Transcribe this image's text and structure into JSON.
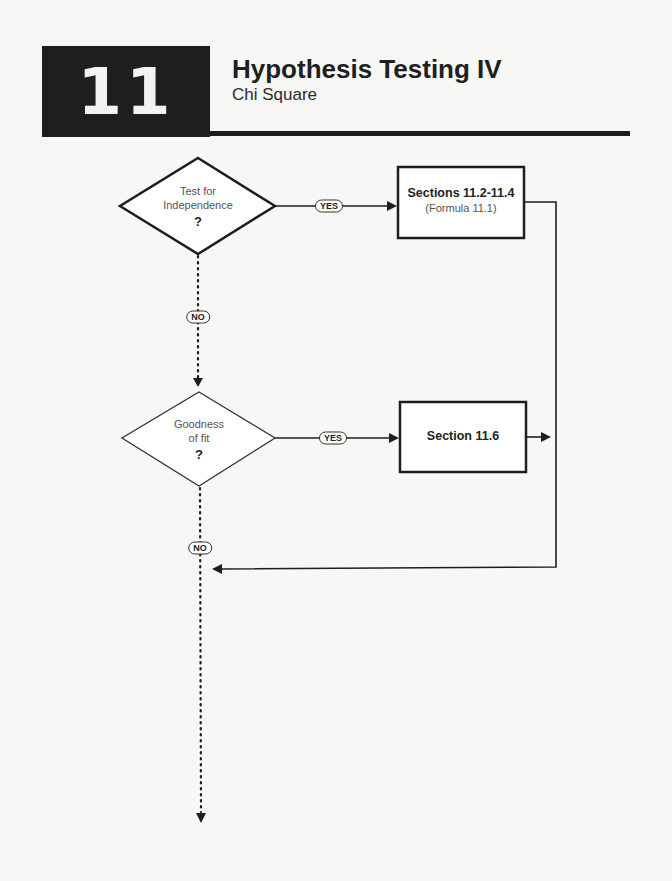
{
  "header": {
    "chapter_number": "11",
    "title": "Hypothesis Testing IV",
    "subtitle": "Chi Square"
  },
  "flowchart": {
    "decisions": [
      {
        "label_line1": "Test for",
        "label_line2": "Independence",
        "mark": "?"
      },
      {
        "label_line1": "Goodness",
        "label_line2": "of fit",
        "mark": "?"
      }
    ],
    "boxes": [
      {
        "title": "Sections 11.2-11.4",
        "subtitle": "(Formula 11.1)"
      },
      {
        "title": "Section 11.6"
      }
    ],
    "edge_labels": {
      "yes_1": "YES",
      "no_1": "NO",
      "yes_2": "YES",
      "no_2": "NO"
    }
  }
}
